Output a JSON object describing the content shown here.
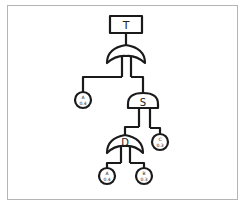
{
  "diagram": {
    "type": "fault-tree",
    "top_event": {
      "label": "T"
    },
    "gates": [
      {
        "id": "g_top",
        "type": "OR",
        "label": "",
        "parent": "T",
        "children": [
          "A1",
          "S"
        ]
      },
      {
        "id": "S",
        "type": "AND",
        "label": "S",
        "children": [
          "D",
          "C"
        ]
      },
      {
        "id": "D",
        "type": "OR",
        "label": "D",
        "children": [
          "A2",
          "B"
        ]
      }
    ],
    "basic_events": [
      {
        "id": "A1",
        "label": "A",
        "prob": "0.4"
      },
      {
        "id": "C",
        "label": "C",
        "prob": "0.3"
      },
      {
        "id": "A2",
        "label": "A",
        "prob": "0.4"
      },
      {
        "id": "B",
        "label": "B",
        "prob": "0.3"
      }
    ]
  },
  "colors": {
    "stroke": "#1a1a1a",
    "frame": "#b5b5b5",
    "background": "#ffffff"
  }
}
